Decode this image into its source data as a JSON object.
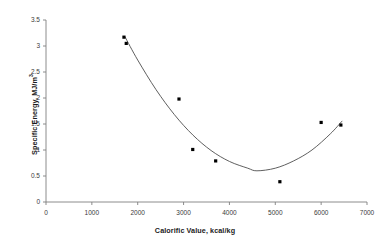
{
  "chart_data": {
    "type": "scatter",
    "title": "",
    "xlabel": "Calorific Value, kcal/kg",
    "ylabel_text": "Specific Energy, MJ/m",
    "ylabel_sup": "3",
    "xlim": [
      0,
      7000
    ],
    "ylim": [
      0,
      3.5
    ],
    "xticks": [
      0,
      1000,
      2000,
      3000,
      4000,
      5000,
      6000,
      7000
    ],
    "xtick_labels": [
      "0",
      "1000",
      "2000",
      "3000",
      "4000",
      "5000",
      "6000",
      "7000"
    ],
    "yticks": [
      0,
      0.5,
      1,
      1.5,
      2,
      2.5,
      3,
      3.5
    ],
    "ytick_labels": [
      "0",
      "0.5",
      "1",
      "1.5",
      "2",
      "2.5",
      "3",
      "3.5"
    ],
    "grid": false,
    "legend": false,
    "marker_color": "#000000",
    "marker_shape": "square",
    "marker_size": 3.2,
    "line_color": "#4d4d4d",
    "axis_color": "#808080",
    "points": [
      {
        "x": 1700,
        "y": 3.17
      },
      {
        "x": 1750,
        "y": 3.05
      },
      {
        "x": 2900,
        "y": 1.98
      },
      {
        "x": 3200,
        "y": 1.01
      },
      {
        "x": 3700,
        "y": 0.79
      },
      {
        "x": 5100,
        "y": 0.39
      },
      {
        "x": 6000,
        "y": 1.53
      },
      {
        "x": 6430,
        "y": 1.48
      }
    ],
    "fit_curve": {
      "type": "quadratic",
      "x_start": 1720,
      "x_end": 6460,
      "vertex_x": 4600,
      "vertex_y": 0.6,
      "a": 3.2e-07,
      "points": [
        {
          "x": 1720,
          "y": 3.18
        },
        {
          "x": 2000,
          "y": 2.73
        },
        {
          "x": 2400,
          "y": 2.16
        },
        {
          "x": 2800,
          "y": 1.68
        },
        {
          "x": 3200,
          "y": 1.29
        },
        {
          "x": 3600,
          "y": 0.99
        },
        {
          "x": 4000,
          "y": 0.78
        },
        {
          "x": 4400,
          "y": 0.65
        },
        {
          "x": 4600,
          "y": 0.6
        },
        {
          "x": 5000,
          "y": 0.65
        },
        {
          "x": 5400,
          "y": 0.79
        },
        {
          "x": 5800,
          "y": 1.0
        },
        {
          "x": 6200,
          "y": 1.31
        },
        {
          "x": 6460,
          "y": 1.56
        }
      ]
    }
  }
}
